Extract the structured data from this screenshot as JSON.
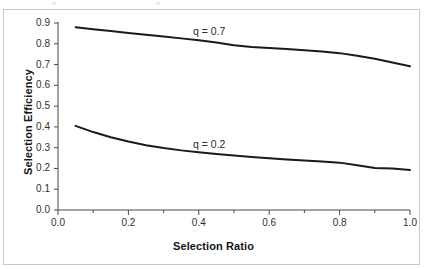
{
  "figure": {
    "frame_color": "#c9c9c9",
    "background": "#ffffff",
    "line_color": "#1a1a1a",
    "axis_color": "#4a4a4a"
  },
  "chart_data": {
    "type": "line",
    "title": "",
    "xlabel": "Selection Ratio",
    "ylabel": "Selection Efficiency",
    "xlim": [
      0.0,
      1.0
    ],
    "ylim": [
      0.0,
      0.9
    ],
    "grid": false,
    "legend_position": "inline-annotation",
    "x_ticks": [
      "0.0",
      "0.2",
      "0.4",
      "0.6",
      "0.8",
      "1.0"
    ],
    "x_tick_values": [
      0.0,
      0.2,
      0.4,
      0.6,
      0.8,
      1.0
    ],
    "x_minor_tick_values": [
      0.1,
      0.3,
      0.5,
      0.7,
      0.9
    ],
    "y_ticks": [
      "0.0",
      "0.1",
      "0.2",
      "0.3",
      "0.4",
      "0.5",
      "0.6",
      "0.7",
      "0.8",
      "0.9"
    ],
    "y_tick_values": [
      0.0,
      0.1,
      0.2,
      0.3,
      0.4,
      0.5,
      0.6,
      0.7,
      0.8,
      0.9
    ],
    "series": [
      {
        "name": "q = 0.7",
        "label": "q = 0.7",
        "color": "#1a1a1a",
        "x": [
          0.05,
          0.1,
          0.15,
          0.2,
          0.25,
          0.3,
          0.35,
          0.4,
          0.45,
          0.5,
          0.55,
          0.6,
          0.65,
          0.7,
          0.75,
          0.8,
          0.85,
          0.9,
          0.95,
          1.0
        ],
        "values": [
          0.88,
          0.87,
          0.861,
          0.852,
          0.843,
          0.835,
          0.826,
          0.817,
          0.806,
          0.793,
          0.785,
          0.78,
          0.775,
          0.769,
          0.763,
          0.755,
          0.742,
          0.728,
          0.71,
          0.692
        ]
      },
      {
        "name": "q = 0.2",
        "label": "q = 0.2",
        "color": "#1a1a1a",
        "x": [
          0.05,
          0.1,
          0.15,
          0.2,
          0.25,
          0.3,
          0.35,
          0.4,
          0.45,
          0.5,
          0.55,
          0.6,
          0.65,
          0.7,
          0.75,
          0.8,
          0.85,
          0.9,
          0.95,
          1.0
        ],
        "values": [
          0.405,
          0.375,
          0.35,
          0.33,
          0.312,
          0.298,
          0.287,
          0.278,
          0.27,
          0.262,
          0.255,
          0.249,
          0.243,
          0.238,
          0.233,
          0.228,
          0.215,
          0.202,
          0.2,
          0.193
        ]
      }
    ],
    "annotations": [
      {
        "text": "q = 0.7",
        "x": 0.44,
        "y": 0.845
      },
      {
        "text": "q = 0.2",
        "x": 0.44,
        "y": 0.355
      }
    ]
  }
}
